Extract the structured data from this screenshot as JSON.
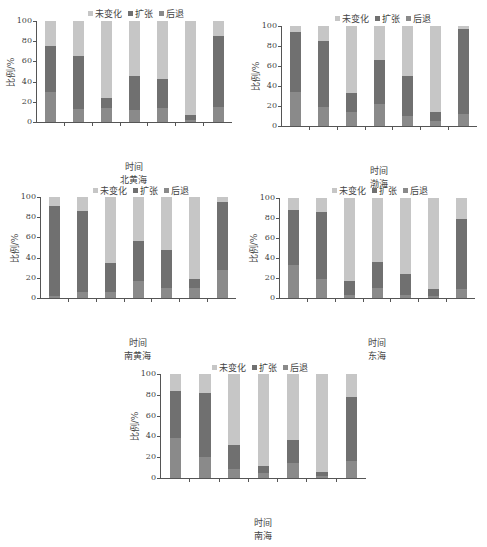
{
  "legend": {
    "unchanged": "未变化",
    "expand": "扩张",
    "retreat": "后退"
  },
  "colors": {
    "unchanged": "#c6c6c6",
    "expand": "#707070",
    "retreat": "#8a8a8a"
  },
  "y_ticks": [
    "100",
    "80",
    "60",
    "40",
    "20",
    "0"
  ],
  "ylabel": "比例/%",
  "xlabel": "时间",
  "chart_data": [
    {
      "type": "bar",
      "stacked": true,
      "title": "北黄海",
      "xlabel": "时间",
      "ylabel": "比例/%",
      "ylim": [
        0,
        100
      ],
      "categories": [
        "1940s~1960s",
        "1960s~1990",
        "1990~2000",
        "2000~2010",
        "2010~2015",
        "2015~2020",
        "1940s~2020"
      ],
      "series": [
        {
          "name": "后退",
          "values": [
            30,
            13,
            14,
            12,
            14,
            2,
            15
          ]
        },
        {
          "name": "扩张",
          "values": [
            45,
            52,
            10,
            34,
            29,
            5,
            70
          ]
        },
        {
          "name": "未变化",
          "values": [
            25,
            35,
            76,
            54,
            57,
            93,
            15
          ]
        }
      ],
      "legend_position": "top"
    },
    {
      "type": "bar",
      "stacked": true,
      "title": "渤海",
      "xlabel": "时间",
      "ylabel": "比例/%",
      "ylim": [
        0,
        100
      ],
      "categories": [
        "",
        "1960s~1990",
        "1990~2000",
        "2000~2010",
        "2010~2015",
        "2015~2020",
        "1940s~2020"
      ],
      "series": [
        {
          "name": "后退",
          "values": [
            34,
            19,
            14,
            22,
            10,
            5,
            12
          ]
        },
        {
          "name": "扩张",
          "values": [
            60,
            66,
            19,
            44,
            40,
            9,
            85
          ]
        },
        {
          "name": "未变化",
          "values": [
            6,
            15,
            67,
            34,
            50,
            86,
            3
          ]
        }
      ],
      "legend_position": "top"
    },
    {
      "type": "bar",
      "stacked": true,
      "title": "南黄海",
      "xlabel": "时间",
      "ylabel": "比例/%",
      "ylim": [
        0,
        100
      ],
      "categories": [
        "1940s~1960s",
        "1960s~1990",
        "1990~2000",
        "2000~2010",
        "2010~2015",
        "2015~2020",
        "1940s~2020"
      ],
      "series": [
        {
          "name": "后退",
          "values": [
            2,
            6,
            6,
            17,
            10,
            10,
            28
          ]
        },
        {
          "name": "扩张",
          "values": [
            89,
            80,
            29,
            39,
            38,
            9,
            67
          ]
        },
        {
          "name": "未变化",
          "values": [
            9,
            14,
            65,
            44,
            52,
            81,
            5
          ]
        }
      ],
      "legend_position": "top"
    },
    {
      "type": "bar",
      "stacked": true,
      "title": "东海",
      "xlabel": "时间",
      "ylabel": "比例/%",
      "ylim": [
        0,
        100
      ],
      "categories": [
        "1940s~1960s",
        "1960s~1990",
        "1990~2000",
        "2000~2010",
        "2010~2015",
        "2015~2020",
        "1940s~2020"
      ],
      "series": [
        {
          "name": "后退",
          "values": [
            33,
            19,
            3,
            10,
            3,
            2,
            9
          ]
        },
        {
          "name": "扩张",
          "values": [
            55,
            67,
            14,
            26,
            21,
            7,
            70
          ]
        },
        {
          "name": "未变化",
          "values": [
            12,
            14,
            83,
            64,
            76,
            91,
            21
          ]
        }
      ],
      "legend_position": "top"
    },
    {
      "type": "bar",
      "stacked": true,
      "title": "南海",
      "xlabel": "时间",
      "ylabel": "比例/%",
      "ylim": [
        0,
        100
      ],
      "categories": [
        "1940s~1960s",
        "1960s~1990",
        "1990~2000",
        "2000~2010",
        "2010~2015",
        "2015~2020",
        "1940s~2020"
      ],
      "series": [
        {
          "name": "后退",
          "values": [
            38,
            20,
            9,
            5,
            14,
            2,
            16
          ]
        },
        {
          "name": "扩张",
          "values": [
            46,
            62,
            23,
            7,
            23,
            4,
            62
          ]
        },
        {
          "name": "未变化",
          "values": [
            16,
            18,
            68,
            88,
            63,
            94,
            22
          ]
        }
      ],
      "legend_position": "top"
    }
  ]
}
